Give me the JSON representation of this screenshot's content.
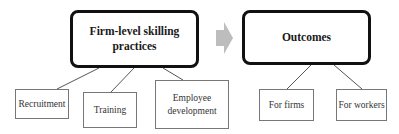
{
  "diagram": {
    "main_nodes": [
      {
        "id": "practices",
        "label": "Firm-level skilling practices"
      },
      {
        "id": "outcomes",
        "label": "Outcomes"
      }
    ],
    "practices_children": [
      {
        "label": "Recruitment"
      },
      {
        "label": "Training"
      },
      {
        "label": "Employee development"
      }
    ],
    "outcomes_children": [
      {
        "label": "For firms"
      },
      {
        "label": "For workers"
      }
    ],
    "flow": {
      "from": "practices",
      "to": "outcomes",
      "arrow_icon": "right-arrow-icon"
    },
    "colors": {
      "main_border": "#111111",
      "sub_border": "#777777",
      "connector": "#555555",
      "arrow_fill": "#bdbdbd",
      "text": "#222222"
    }
  }
}
